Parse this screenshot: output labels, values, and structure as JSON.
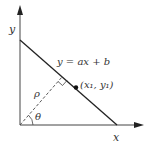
{
  "diagram": {
    "axes": {
      "x_label": "x",
      "y_label": "y"
    },
    "line": {
      "equation_label": "y = ax + b"
    },
    "point": {
      "label": "(x₁, y₁)"
    },
    "normal": {
      "distance_label": "ρ",
      "angle_label": "θ"
    },
    "colors": {
      "stroke": "#333333",
      "background": "#ffffff"
    }
  }
}
